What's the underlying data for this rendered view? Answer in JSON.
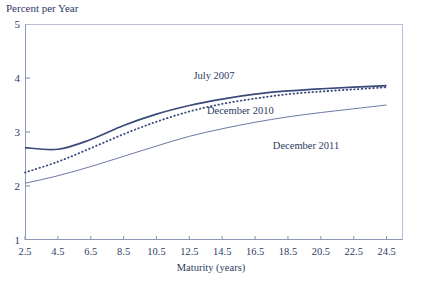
{
  "chart_data": {
    "type": "line",
    "title": "Percent per Year",
    "xlabel": "Maturity (years)",
    "ylabel": "Percent per Year",
    "xlim": [
      2.5,
      25.5
    ],
    "ylim": [
      1,
      5
    ],
    "grid": false,
    "legend_position": "inline-annotations",
    "xticks": [
      "2.5",
      "4.5",
      "6.5",
      "8.5",
      "10.5",
      "12.5",
      "14.5",
      "16.5",
      "18.5",
      "20.5",
      "22.5",
      "24.5"
    ],
    "yticks": [
      "1",
      "2",
      "3",
      "4",
      "5"
    ],
    "x": [
      2.5,
      4.5,
      6.5,
      8.5,
      10.5,
      12.5,
      14.5,
      16.5,
      18.5,
      20.5,
      22.5,
      24.5
    ],
    "series": [
      {
        "name": "July 2007",
        "style": "solid-thick",
        "color": "#3a4a7a",
        "values": [
          2.71,
          2.68,
          2.86,
          3.12,
          3.33,
          3.49,
          3.61,
          3.7,
          3.76,
          3.8,
          3.83,
          3.86
        ]
      },
      {
        "name": "December 2010",
        "style": "dotted",
        "color": "#3a4a7a",
        "values": [
          2.25,
          2.45,
          2.7,
          2.96,
          3.19,
          3.38,
          3.52,
          3.62,
          3.7,
          3.75,
          3.79,
          3.83
        ]
      },
      {
        "name": "December 2011",
        "style": "solid-thin",
        "color": "#6d79a5",
        "values": [
          2.05,
          2.19,
          2.36,
          2.55,
          2.74,
          2.92,
          3.06,
          3.18,
          3.28,
          3.36,
          3.43,
          3.5
        ]
      }
    ],
    "annotations": [
      {
        "text": "July 2007",
        "x": 14.0,
        "y": 4.06
      },
      {
        "text": "December 2010",
        "x": 15.6,
        "y": 3.4
      },
      {
        "text": "December 2011",
        "x": 19.6,
        "y": 2.76
      }
    ]
  }
}
